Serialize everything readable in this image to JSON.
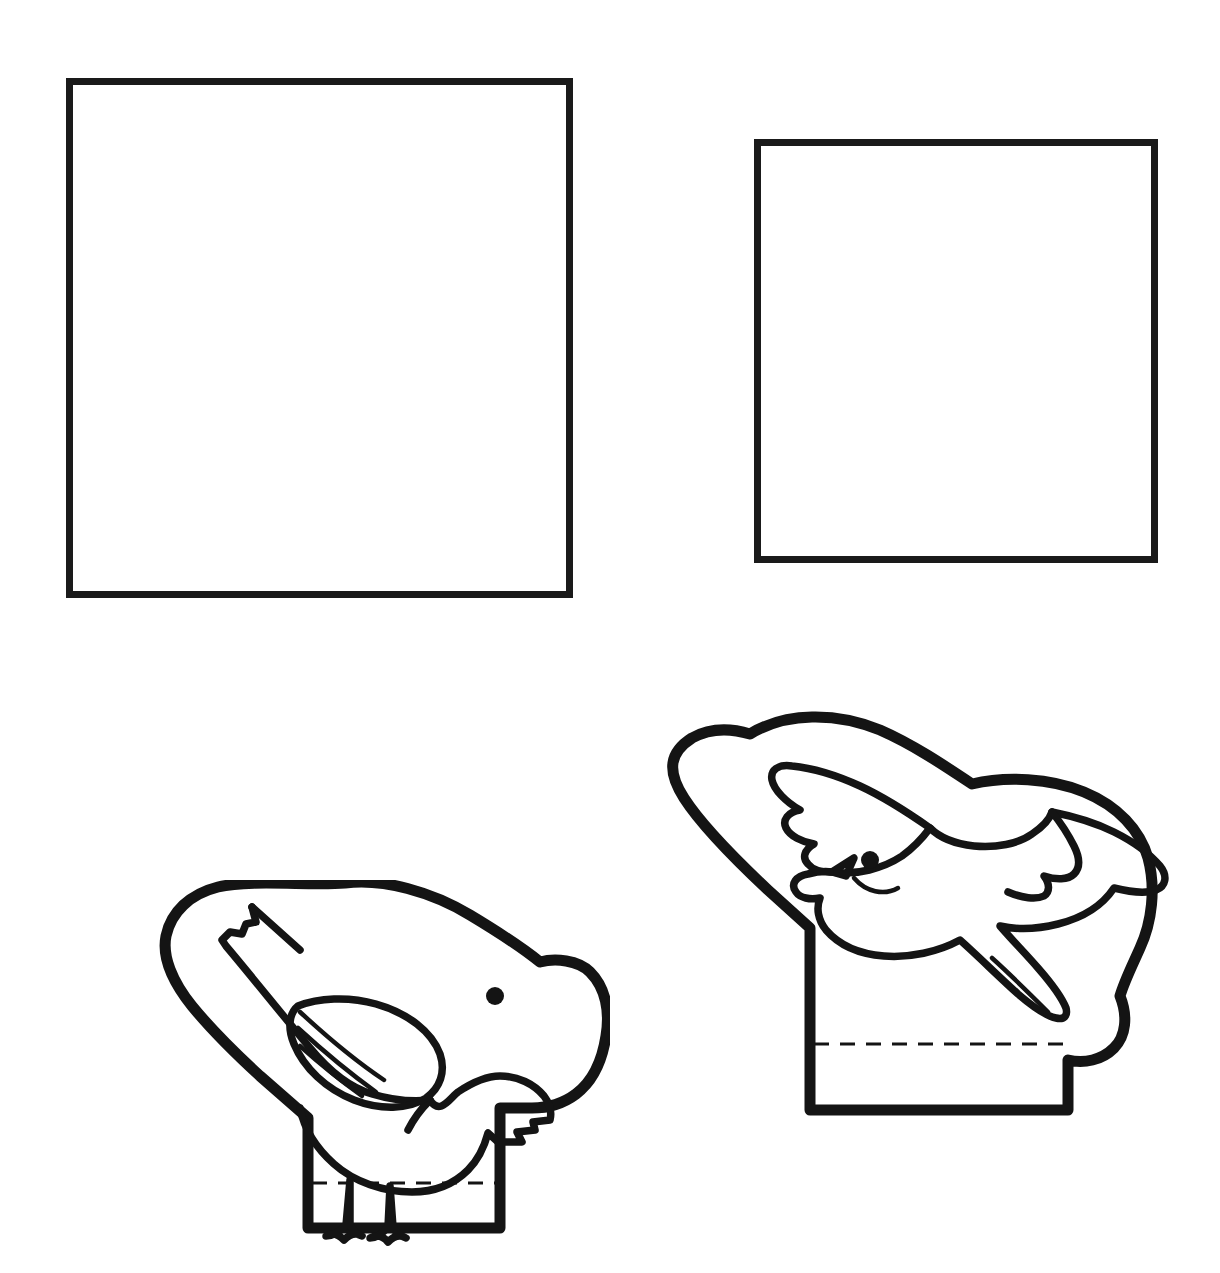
{
  "page": {
    "background_color": "#ffffff",
    "ink_color": "#141414",
    "width": 1220,
    "height": 1273
  },
  "shapes": {
    "square_one": {
      "name": "blank-square-large",
      "label": "",
      "x": 66,
      "y": 78,
      "width": 507,
      "height": 520,
      "stroke_width": 7,
      "stroke_color": "#1a1a1a",
      "fill": "none"
    },
    "square_two": {
      "name": "blank-square-small",
      "label": "",
      "x": 754,
      "y": 139,
      "width": 404,
      "height": 424,
      "stroke_width": 7,
      "stroke_color": "#1a1a1a",
      "fill": "none"
    }
  },
  "figures": [
    {
      "id": "standing-bird",
      "label": "",
      "description": "standing bird puppet cutout with finger band tab",
      "x": 140,
      "y": 880,
      "width": 470,
      "height": 370,
      "fold_line": {
        "style": "dashed",
        "dash": "15 11",
        "stroke_width": 3
      },
      "eye_color": "#141414"
    },
    {
      "id": "flying-bird",
      "label": "",
      "description": "flying dove puppet cutout with finger band tab",
      "x": 640,
      "y": 700,
      "width": 530,
      "height": 430,
      "fold_line": {
        "style": "dashed",
        "dash": "15 11",
        "stroke_width": 3
      },
      "eye_color": "#141414"
    }
  ],
  "icons": {
    "bird_standing": "bird-standing-icon",
    "bird_flying": "bird-flying-icon",
    "fold_line": "dashed-fold-line-icon"
  }
}
